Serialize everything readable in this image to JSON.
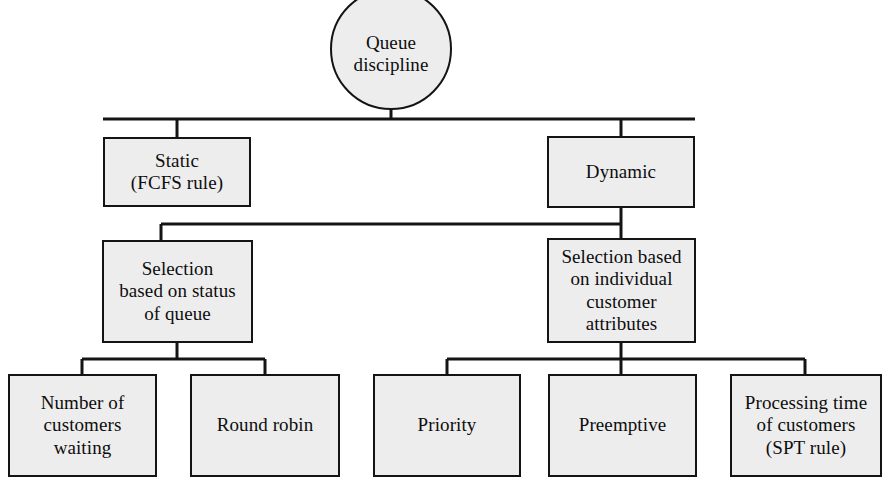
{
  "diagram": {
    "style": {
      "box_fill": "#ededed",
      "box_stroke": "#141414",
      "edge_stroke": "#141414",
      "background": "#ffffff",
      "text_color": "#0d0d0d"
    },
    "nodes": {
      "root": {
        "label": "Queue\ndiscipline"
      },
      "static": {
        "label": "Static\n(FCFS rule)"
      },
      "dynamic": {
        "label": "Dynamic"
      },
      "status_of_queue": {
        "label": "Selection\nbased on status\nof queue"
      },
      "customer_attributes": {
        "label": "Selection based\non individual\ncustomer\nattributes"
      },
      "number_waiting": {
        "label": "Number of\ncustomers\nwaiting"
      },
      "round_robin": {
        "label": "Round robin"
      },
      "priority": {
        "label": "Priority"
      },
      "preemptive": {
        "label": "Preemptive"
      },
      "processing_time": {
        "label": "Processing time\nof customers\n(SPT rule)"
      }
    }
  }
}
